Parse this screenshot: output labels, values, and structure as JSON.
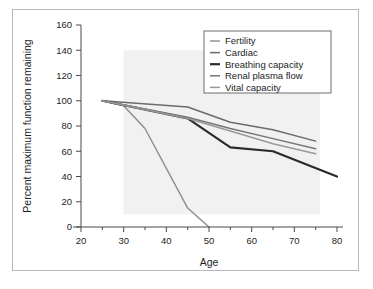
{
  "chart_data": {
    "type": "line",
    "title": "",
    "xlabel": "Age",
    "ylabel": "Percent maximum function remaining",
    "xlim": [
      20,
      80
    ],
    "ylim": [
      0,
      160
    ],
    "xticks": [
      20,
      30,
      40,
      50,
      60,
      70,
      80
    ],
    "yticks": [
      0,
      20,
      40,
      60,
      80,
      100,
      120,
      140,
      160
    ],
    "xtick_labels": [
      "20",
      "30",
      "40",
      "50",
      "60",
      "70",
      "80"
    ],
    "ytick_labels": [
      "0",
      "20",
      "40",
      "60",
      "80",
      "100",
      "120",
      "140",
      "160"
    ],
    "minor_xtick_step": 5,
    "grid": false,
    "legend_position": "upper right",
    "series": [
      {
        "name": "Fertility",
        "color": "#8c8c8c",
        "width": 1.4,
        "x": [
          25,
          30,
          35,
          45,
          50
        ],
        "values": [
          100,
          96,
          78,
          15,
          0
        ]
      },
      {
        "name": "Cardiac",
        "color": "#6b6b6b",
        "width": 1.5,
        "x": [
          25,
          45,
          55,
          65,
          75
        ],
        "values": [
          100,
          95,
          83,
          77,
          68
        ]
      },
      {
        "name": "Breathing capacity",
        "color": "#2b2b2b",
        "width": 2.2,
        "x": [
          25,
          45,
          55,
          65,
          80
        ],
        "values": [
          100,
          86,
          63,
          60,
          40
        ]
      },
      {
        "name": "Renal plasma flow",
        "color": "#757575",
        "width": 1.5,
        "x": [
          25,
          45,
          55,
          65,
          75
        ],
        "values": [
          100,
          87,
          78,
          70,
          62
        ]
      },
      {
        "name": "Vital capacity",
        "color": "#989898",
        "width": 1.5,
        "x": [
          25,
          45,
          55,
          65,
          75
        ],
        "values": [
          100,
          86,
          76,
          66,
          58
        ]
      }
    ]
  },
  "legend": {
    "entries": [
      {
        "label": "Fertility"
      },
      {
        "label": "Cardiac"
      },
      {
        "label": "Breathing capacity"
      },
      {
        "label": "Renal plasma flow"
      },
      {
        "label": "Vital capacity"
      }
    ]
  },
  "colors": {
    "frame": "#b9b9b9",
    "axis": "#4a4a4a",
    "plot_background": "#f1f1f1",
    "page_background": "#ffffff",
    "text": "#1d1d1d"
  }
}
